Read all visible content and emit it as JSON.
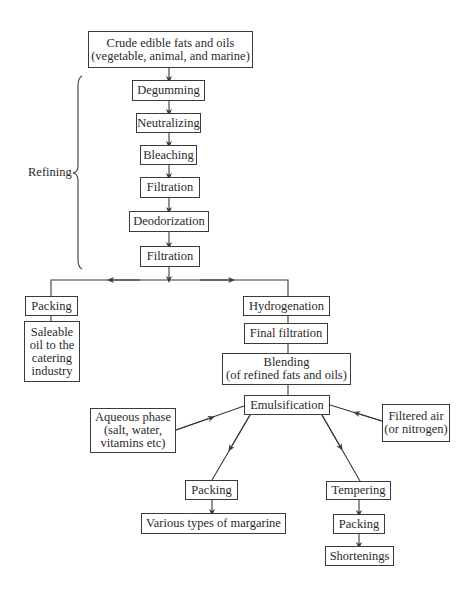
{
  "diagram": {
    "type": "flowchart",
    "nodes": {
      "crude": "Crude edible fats and oils\n(vegetable, animal, and marine)",
      "degumming": "Degumming",
      "neutralizing": "Neutralizing",
      "bleaching": "Bleaching",
      "filtration1": "Filtration",
      "deodorization": "Deodorization",
      "filtration2": "Filtration",
      "packing_left": "Packing",
      "saleable": "Saleable\noil to the\ncatering\nindustry",
      "hydrogenation": "Hydrogenation",
      "final_filtration": "Final filtration",
      "blending": "Blending\n(of refined fats and oils)",
      "emulsification": "Emulsification",
      "aqueous": "Aqueous phase\n(salt, water,\nvitamins etc)",
      "filtered_air": "Filtered air\n(or nitrogen)",
      "packing_margarine": "Packing",
      "margarine": "Various types of margarine",
      "tempering": "Tempering",
      "packing_shortening": "Packing",
      "shortenings": "Shortenings"
    },
    "group_label": "Refining",
    "edges": [
      [
        "crude",
        "degumming"
      ],
      [
        "degumming",
        "neutralizing"
      ],
      [
        "neutralizing",
        "bleaching"
      ],
      [
        "bleaching",
        "filtration1"
      ],
      [
        "filtration1",
        "deodorization"
      ],
      [
        "deodorization",
        "filtration2"
      ],
      [
        "filtration2",
        "packing_left"
      ],
      [
        "filtration2",
        "hydrogenation"
      ],
      [
        "packing_left",
        "saleable"
      ],
      [
        "hydrogenation",
        "final_filtration"
      ],
      [
        "final_filtration",
        "blending"
      ],
      [
        "blending",
        "emulsification"
      ],
      [
        "aqueous",
        "emulsification"
      ],
      [
        "filtered_air",
        "emulsification"
      ],
      [
        "emulsification",
        "packing_margarine"
      ],
      [
        "emulsification",
        "tempering"
      ],
      [
        "packing_margarine",
        "margarine"
      ],
      [
        "tempering",
        "packing_shortening"
      ],
      [
        "packing_shortening",
        "shortenings"
      ]
    ]
  }
}
